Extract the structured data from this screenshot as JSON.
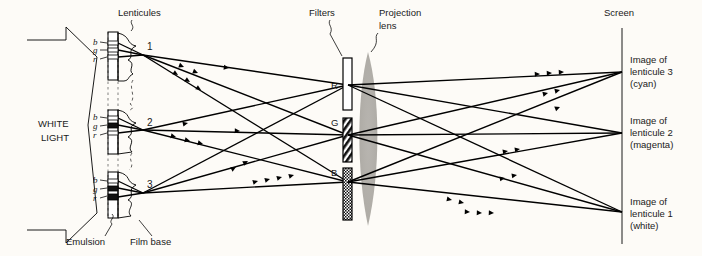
{
  "figure": {
    "background": "#fdfbf7",
    "lens_color": "#b3b0ab",
    "ink": "#000000"
  },
  "labels": {
    "lenticules": "Lenticules",
    "white_light_line1": "WHITE",
    "white_light_line2": "LIGHT",
    "emulsion": "Emulsion",
    "film_base": "Film base",
    "filters": "Filters",
    "projection_lens_line1": "Projection",
    "projection_lens_line2": "lens",
    "screen": "Screen"
  },
  "lenticules": [
    {
      "number": "1",
      "bands": [
        "b",
        "g",
        "r"
      ],
      "band_fill": [
        "clear",
        "clear",
        "clear"
      ],
      "vertex": {
        "x": 143,
        "y": 55
      }
    },
    {
      "number": "2",
      "bands": [
        "b",
        "g",
        "r"
      ],
      "band_fill": [
        "clear",
        "black",
        "clear"
      ],
      "vertex": {
        "x": 143,
        "y": 130
      }
    },
    {
      "number": "3",
      "bands": [
        "b",
        "g",
        "r"
      ],
      "band_fill": [
        "clear",
        "black",
        "black"
      ],
      "vertex": {
        "x": 143,
        "y": 193
      }
    }
  ],
  "filters": [
    {
      "label": "R",
      "node": {
        "x": 348,
        "y": 85
      },
      "pattern": "clear"
    },
    {
      "label": "G",
      "node": {
        "x": 348,
        "y": 135
      },
      "pattern": "diagonal-hatch"
    },
    {
      "label": "B",
      "node": {
        "x": 348,
        "y": 182
      },
      "pattern": "dense-stipple"
    }
  ],
  "screen": {
    "x": 622,
    "images": [
      {
        "line1": "Image of",
        "line2": "lenticule 3",
        "line3": "(cyan)",
        "y": 72
      },
      {
        "line1": "Image of",
        "line2": "lenticule 2",
        "line3": "(magenta)",
        "y": 133
      },
      {
        "line1": "Image of",
        "line2": "lenticule 1",
        "line3": "(white)",
        "y": 212
      }
    ]
  },
  "ray_paths": [
    {
      "from_lenticule": "1",
      "via_filter": "R",
      "to_image": "lenticule 1"
    },
    {
      "from_lenticule": "1",
      "via_filter": "G",
      "to_image": "lenticule 1"
    },
    {
      "from_lenticule": "1",
      "via_filter": "B",
      "to_image": "lenticule 1"
    },
    {
      "from_lenticule": "2",
      "via_filter": "R",
      "to_image": "lenticule 2"
    },
    {
      "from_lenticule": "2",
      "via_filter": "G",
      "to_image": "lenticule 2"
    },
    {
      "from_lenticule": "2",
      "via_filter": "B",
      "to_image": "lenticule 2"
    },
    {
      "from_lenticule": "3",
      "via_filter": "R",
      "to_image": "lenticule 3"
    },
    {
      "from_lenticule": "3",
      "via_filter": "G",
      "to_image": "lenticule 3"
    },
    {
      "from_lenticule": "3",
      "via_filter": "B",
      "to_image": "lenticule 3"
    }
  ]
}
